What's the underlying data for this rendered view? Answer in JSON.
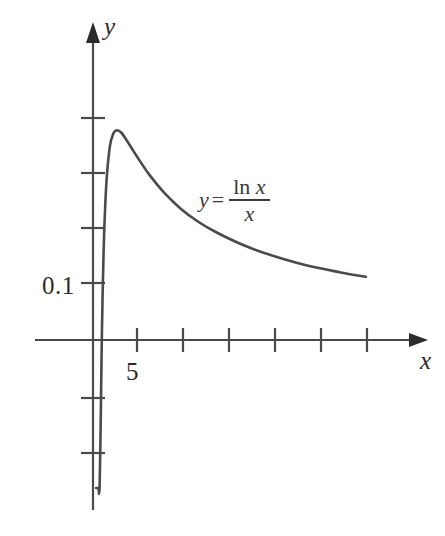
{
  "figure": {
    "type": "math-function-graph",
    "background_color": "#ffffff",
    "ink_color": "#3a3a3a"
  },
  "labels": {
    "y_axis": "y",
    "x_axis": "x",
    "y_tick_0p1": "0.1",
    "x_tick_5": "5"
  },
  "equation": {
    "lhs": "y",
    "equals": "=",
    "numerator_ln": "ln",
    "numerator_x": "x",
    "denominator": "x"
  },
  "chart_data": {
    "type": "line",
    "title": "",
    "subtitle": "",
    "xlabel": "x",
    "ylabel": "y",
    "annotations": [
      "y = ln x / x"
    ],
    "legend": [],
    "legend_position": "none",
    "grid": false,
    "axis_style": "arrowed-cartesian",
    "xlim": [
      -1.3,
      38
    ],
    "ylim": [
      -0.45,
      0.33
    ],
    "xticks": [
      5,
      10,
      15,
      20,
      25,
      30
    ],
    "xtick_labels": [
      "5",
      "",
      "",
      "",
      "",
      ""
    ],
    "yticks": [
      -0.3,
      -0.1,
      0.1,
      0.2,
      0.3,
      0.4
    ],
    "ytick_labels": [
      "",
      "",
      "0.1",
      "",
      "",
      ""
    ],
    "series": [
      {
        "name": "y = ln x / x",
        "color": "#4a4a4a",
        "x": [
          0.35,
          0.45,
          0.6,
          0.75,
          0.9,
          1.0,
          1.2,
          1.5,
          1.9,
          2.3,
          2.718,
          3.2,
          3.8,
          4.5,
          5.5,
          6.5,
          8.0,
          10.0,
          12.0,
          14.0,
          17.0,
          20.0,
          24.0,
          28.0,
          31.0
        ],
        "y": [
          -3.0,
          -1.774,
          -0.851,
          -0.383,
          -0.117,
          0.0,
          0.152,
          0.27,
          0.338,
          0.362,
          0.368,
          0.364,
          0.351,
          0.334,
          0.31,
          0.288,
          0.26,
          0.23,
          0.207,
          0.189,
          0.167,
          0.15,
          0.132,
          0.119,
          0.111
        ]
      }
    ],
    "features": {
      "maximum_at_x": 2.718,
      "maximum_y": 0.368,
      "x_intercept": 1.0,
      "asymptote": "x = 0 (vertical), y = 0 as x -> infinity"
    }
  }
}
